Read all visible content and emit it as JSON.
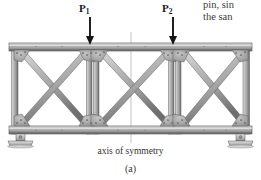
{
  "figure": {
    "kind": "structural-truss-diagram",
    "subfigure_label": "(a)",
    "axis_caption": "axis of symmetry",
    "body_text": {
      "line_1": "pin, sin",
      "line_2": "the san"
    },
    "loads": [
      {
        "id": "P1",
        "label": "P",
        "subscript": "1",
        "x": 90,
        "direction": "down"
      },
      {
        "id": "P2",
        "label": "P",
        "subscript": "2",
        "x": 173,
        "direction": "down"
      }
    ],
    "colors": {
      "member_fill": "#a8a8a8",
      "member_light": "#d8d8d8",
      "member_dark": "#6e6e6e",
      "outline": "#4a4a4a",
      "gusset": "#9a9a9a",
      "rivet": "#5a5a5a",
      "support": "#bdbdbd",
      "axis_line": "#b8b8b8",
      "arrow": "#161616",
      "text": "#2b2b2b",
      "background": "#ffffff"
    },
    "geometry": {
      "top_chord_y": 45,
      "bottom_chord_y": 130,
      "left_end_x": 13,
      "right_end_x": 248,
      "panel_dividers_x": [
        90,
        173
      ],
      "axis_of_symmetry_x": 131,
      "panel_count": 3,
      "bracing": "X-cross"
    },
    "supports": [
      {
        "id": "left-support",
        "type": "pin",
        "x": 20,
        "y": 134
      },
      {
        "id": "right-support",
        "type": "pin",
        "x": 241,
        "y": 134
      }
    ]
  }
}
